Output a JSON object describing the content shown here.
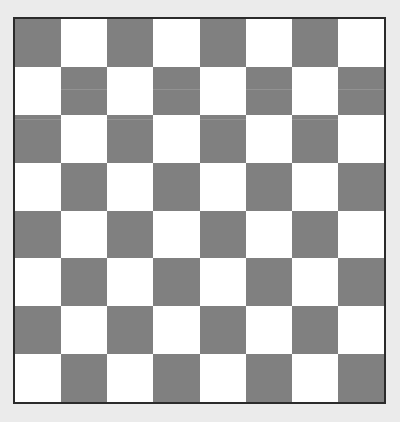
{
  "image": {
    "title": "Checkerboard",
    "description": "8 by 8 alternating gray and white checkerboard with thin dark border on a light gray background",
    "background_color": "#ebebeb",
    "width": 400,
    "height": 422
  },
  "board": {
    "name": "checkerboard",
    "rows": 8,
    "columns": 8,
    "total_squares": 64,
    "light_color": "#ffffff",
    "dark_color": "#808080",
    "border_color": "#2b2b2b",
    "border_width": 2,
    "top_left_square_color": "dark",
    "origin_x": 13,
    "origin_y": 17,
    "plate_width": 373,
    "plate_height": 387,
    "square_width": 46,
    "square_height": 48,
    "pattern": [
      [
        "dark",
        "light",
        "dark",
        "light",
        "dark",
        "light",
        "dark",
        "light"
      ],
      [
        "light",
        "dark",
        "light",
        "dark",
        "light",
        "dark",
        "light",
        "dark"
      ],
      [
        "dark",
        "light",
        "dark",
        "light",
        "dark",
        "light",
        "dark",
        "light"
      ],
      [
        "light",
        "dark",
        "light",
        "dark",
        "light",
        "dark",
        "light",
        "dark"
      ],
      [
        "dark",
        "light",
        "dark",
        "light",
        "dark",
        "light",
        "dark",
        "light"
      ],
      [
        "light",
        "dark",
        "light",
        "dark",
        "light",
        "dark",
        "light",
        "dark"
      ],
      [
        "dark",
        "light",
        "dark",
        "light",
        "dark",
        "light",
        "dark",
        "light"
      ],
      [
        "light",
        "dark",
        "light",
        "dark",
        "light",
        "dark",
        "light",
        "dark"
      ]
    ]
  }
}
